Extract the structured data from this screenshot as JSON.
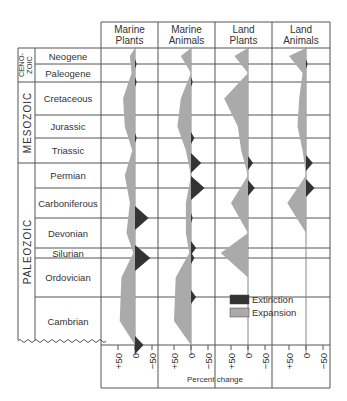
{
  "chart_data": {
    "type": "area",
    "title": "",
    "xlabel": "Percent change",
    "ylabel": "Geologic period",
    "x_ticks": [
      "+50",
      "0",
      "−50"
    ],
    "legend": [
      {
        "label": "Extinction",
        "color": "#333333"
      },
      {
        "label": "Expansion",
        "color": "#aaaaaa"
      }
    ],
    "eras": [
      {
        "name": "CENO-\nZOIC",
        "line1": "CENO-",
        "line2": "ZOIC",
        "periods": [
          "Neogene",
          "Paleogene"
        ]
      },
      {
        "name": "MESOZOIC",
        "periods": [
          "Cretaceous",
          "Jurassic",
          "Triassic"
        ]
      },
      {
        "name": "PALEOZOIC",
        "periods": [
          "Permian",
          "Carboniferous",
          "Devonian",
          "Silurian",
          "Ordovician",
          "Cambrian"
        ]
      }
    ],
    "categories": [
      "Neogene",
      "Paleogene",
      "Cretaceous",
      "Jurassic",
      "Triassic",
      "Permian",
      "Carboniferous",
      "Devonian",
      "Silurian",
      "Ordovician",
      "Cambrian"
    ],
    "series": [
      {
        "name": "Marine Plants",
        "line1": "Marine",
        "line2": "Plants",
        "expansion": [
          15,
          10,
          35,
          30,
          8,
          30,
          15,
          25,
          5,
          40,
          45
        ],
        "extinction": [
          5,
          5,
          0,
          5,
          0,
          0,
          40,
          0,
          45,
          0,
          25
        ]
      },
      {
        "name": "Marine Animals",
        "line1": "Marine",
        "line2": "Animals",
        "expansion": [
          30,
          0,
          30,
          40,
          15,
          0,
          15,
          15,
          5,
          45,
          50
        ],
        "extinction": [
          0,
          5,
          0,
          10,
          30,
          40,
          5,
          15,
          10,
          15,
          0
        ]
      },
      {
        "name": "Land Plants",
        "line1": "Land",
        "line2": "Plants",
        "expansion": [
          40,
          0,
          70,
          30,
          20,
          0,
          50,
          0,
          80,
          0,
          0
        ],
        "extinction": [
          0,
          0,
          0,
          0,
          15,
          20,
          0,
          0,
          0,
          0,
          0
        ]
      },
      {
        "name": "Land Animals",
        "line1": "Land",
        "line2": "Animals",
        "expansion": [
          50,
          10,
          20,
          25,
          10,
          0,
          55,
          0,
          0,
          0,
          0
        ],
        "extinction": [
          5,
          0,
          0,
          0,
          20,
          25,
          0,
          0,
          0,
          0,
          0
        ]
      }
    ],
    "xlim": [
      75,
      -75
    ],
    "grid": true,
    "legend_position": "lower right"
  }
}
